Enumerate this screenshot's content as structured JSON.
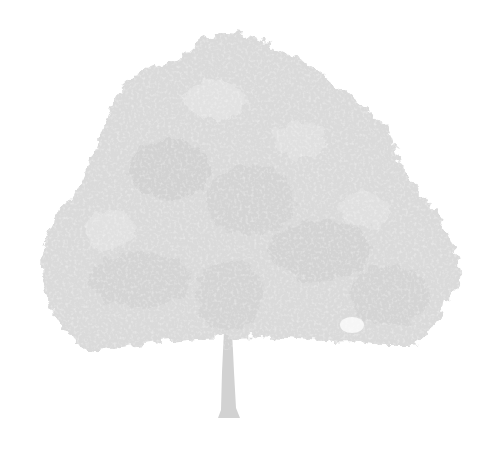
{
  "image": {
    "subject": "deciduous tree silhouette",
    "background_color": "#ffffff",
    "foliage_color": "#dadada",
    "foliage_light_color": "#e6e6e6",
    "foliage_shadow_color": "#cfcfcf",
    "trunk_color": "#d2d2d2"
  }
}
